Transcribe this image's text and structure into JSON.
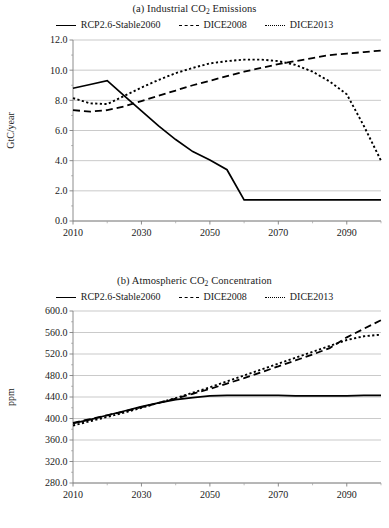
{
  "figure": {
    "panels": [
      {
        "id": "a",
        "title_prefix": "(a) Industrial CO",
        "title_sub": "2",
        "title_suffix": " Emissions",
        "title_full": "(a) Industrial CO2 Emissions",
        "ylabel": "GtC/year"
      },
      {
        "id": "b",
        "title_prefix": "(b) Atmospheric CO",
        "title_sub": "2",
        "title_suffix": " Concentration",
        "title_full": "(b) Atmospheric CO2 Concentration",
        "ylabel": "ppm"
      }
    ],
    "legend": [
      {
        "label": "RCP2.6-Stable2060",
        "style": "solid"
      },
      {
        "label": "DICE2008",
        "style": "dashed"
      },
      {
        "label": "DICE2013",
        "style": "dotted"
      }
    ]
  },
  "chart_data": [
    {
      "type": "line",
      "title": "(a) Industrial CO2 Emissions",
      "xlabel": "",
      "ylabel": "GtC/year",
      "xlim": [
        2010,
        2100
      ],
      "ylim": [
        0.0,
        12.0
      ],
      "ytick_step": 2.0,
      "xticks": [
        2010,
        2030,
        2050,
        2070,
        2090
      ],
      "xtick_labels": [
        "2010",
        "2030",
        "2050",
        "2070",
        "2090"
      ],
      "yticks": [
        0.0,
        2.0,
        4.0,
        6.0,
        8.0,
        10.0,
        12.0
      ],
      "ytick_labels": [
        "0.0",
        "2.0",
        "4.0",
        "6.0",
        "8.0",
        "10.0",
        "12.0"
      ],
      "minor_xticks": [
        2020,
        2040,
        2060,
        2080,
        2100
      ],
      "grid": "horizontal",
      "legend_position": "above-plot",
      "x": [
        2010,
        2015,
        2020,
        2025,
        2030,
        2035,
        2040,
        2045,
        2050,
        2055,
        2060,
        2065,
        2070,
        2075,
        2080,
        2085,
        2090,
        2095,
        2100
      ],
      "series": [
        {
          "name": "RCP2.6-Stable2060",
          "style": "solid",
          "values": [
            8.8,
            9.05,
            9.3,
            8.3,
            7.3,
            6.3,
            5.4,
            4.6,
            4.05,
            3.4,
            1.4,
            1.4,
            1.4,
            1.4,
            1.4,
            1.4,
            1.4,
            1.4,
            1.4
          ]
        },
        {
          "name": "DICE2008",
          "style": "dashed",
          "values": [
            7.35,
            7.25,
            7.35,
            7.6,
            7.95,
            8.3,
            8.65,
            9.0,
            9.3,
            9.6,
            9.9,
            10.15,
            10.4,
            10.6,
            10.8,
            11.0,
            11.1,
            11.2,
            11.3
          ]
        },
        {
          "name": "DICE2013",
          "style": "dotted",
          "values": [
            8.15,
            7.8,
            7.75,
            8.3,
            8.85,
            9.35,
            9.8,
            10.15,
            10.45,
            10.6,
            10.7,
            10.7,
            10.6,
            10.35,
            9.9,
            9.25,
            8.4,
            6.3,
            4.0
          ]
        }
      ]
    },
    {
      "type": "line",
      "title": "(b) Atmospheric CO2 Concentration",
      "xlabel": "",
      "ylabel": "ppm",
      "xlim": [
        2010,
        2100
      ],
      "ylim": [
        280.0,
        600.0
      ],
      "ytick_step": 40.0,
      "xticks": [
        2010,
        2030,
        2050,
        2070,
        2090
      ],
      "xtick_labels": [
        "2010",
        "2030",
        "2050",
        "2070",
        "2090"
      ],
      "yticks": [
        280.0,
        320.0,
        360.0,
        400.0,
        440.0,
        480.0,
        520.0,
        560.0,
        600.0
      ],
      "ytick_labels": [
        "280.0",
        "320.0",
        "360.0",
        "400.0",
        "440.0",
        "480.0",
        "520.0",
        "560.0",
        "600.0"
      ],
      "minor_xticks": [
        2020,
        2040,
        2060,
        2080,
        2100
      ],
      "grid": "horizontal",
      "legend_position": "above-plot",
      "x": [
        2010,
        2015,
        2020,
        2025,
        2030,
        2035,
        2040,
        2045,
        2050,
        2055,
        2060,
        2065,
        2070,
        2075,
        2080,
        2085,
        2090,
        2095,
        2100
      ],
      "series": [
        {
          "name": "RCP2.6-Stable2060",
          "style": "solid",
          "values": [
            391,
            398,
            406,
            414,
            422,
            429,
            435,
            439,
            442,
            443,
            443,
            443,
            443,
            442,
            442,
            442,
            442,
            443,
            443
          ]
        },
        {
          "name": "DICE2008",
          "style": "dashed",
          "values": [
            392,
            399,
            406,
            413,
            421,
            429,
            437,
            446,
            455,
            465,
            475,
            486,
            497,
            508,
            519,
            531,
            551,
            567,
            583
          ]
        },
        {
          "name": "DICE2013",
          "style": "dotted",
          "values": [
            387,
            395,
            403,
            411,
            420,
            429,
            438,
            448,
            458,
            469,
            480,
            491,
            502,
            513,
            524,
            535,
            546,
            553,
            556
          ]
        }
      ]
    }
  ]
}
